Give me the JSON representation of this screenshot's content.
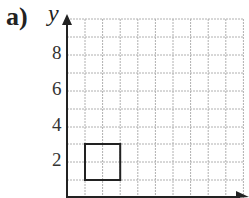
{
  "figure": {
    "part_label": "a)",
    "y_axis_label": "y",
    "y_tick_labels": [
      "8",
      "6",
      "4",
      "2"
    ],
    "grid": {
      "x_min": 0,
      "x_max": 10,
      "y_min": 0,
      "y_max": 10,
      "step": 1
    },
    "shape": {
      "type": "square",
      "corners": [
        [
          1,
          1
        ],
        [
          3,
          1
        ],
        [
          3,
          3
        ],
        [
          1,
          3
        ]
      ]
    },
    "colors": {
      "axis": "#222222",
      "grid": "#b0b0b0",
      "shape": "#222222"
    }
  }
}
